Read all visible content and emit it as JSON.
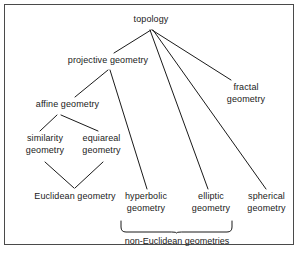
{
  "figure": {
    "type": "hierarchy-tree-diagram",
    "background_color": "#ffffff",
    "line_color": "#1a1a1a",
    "text_color": "#1a1a1a",
    "border_color": "#4a4a4a",
    "width": 299,
    "height": 253
  },
  "nodes": [
    {
      "id": "topology",
      "label": "topology",
      "x": 127,
      "y": 14,
      "w": 48
    },
    {
      "id": "projective-geometry",
      "label": "projective geometry",
      "x": 60,
      "y": 55,
      "w": 96
    },
    {
      "id": "affine-geometry",
      "label": "affine geometry",
      "x": 29,
      "y": 99,
      "w": 77
    },
    {
      "id": "similarity-geometry",
      "label": "similarity\ngeometry",
      "x": 20,
      "y": 133,
      "w": 50
    },
    {
      "id": "equiareal-geometry",
      "label": "equiareal\ngeometry",
      "x": 76,
      "y": 133,
      "w": 51
    },
    {
      "id": "euclidean-geometry",
      "label": "Euclidean geometry",
      "x": 23,
      "y": 191,
      "w": 104
    },
    {
      "id": "hyperbolic-geometry",
      "label": "hyperbolic\ngeometry",
      "x": 120,
      "y": 191,
      "w": 52
    },
    {
      "id": "elliptic-geometry",
      "label": "elliptic\ngeometry",
      "x": 188,
      "y": 191,
      "w": 46
    },
    {
      "id": "spherical-geometry",
      "label": "spherical\ngeometry",
      "x": 241,
      "y": 191,
      "w": 51
    },
    {
      "id": "fractal-geometry",
      "label": "fractal\ngeometry",
      "x": 223,
      "y": 82,
      "w": 46
    }
  ],
  "edges": [
    {
      "from": "topology",
      "to": "projective-geometry",
      "x1": 151,
      "y1": 30,
      "x2": 114,
      "y2": 53
    },
    {
      "from": "topology",
      "to": "fractal-geometry",
      "x1": 152,
      "y1": 30,
      "x2": 231,
      "y2": 80
    },
    {
      "from": "topology",
      "to": "spherical-geometry",
      "x1": 153,
      "y1": 30,
      "x2": 266,
      "y2": 189
    },
    {
      "from": "topology",
      "to": "elliptic-geometry",
      "x1": 150,
      "y1": 30,
      "x2": 208,
      "y2": 189
    },
    {
      "from": "projective-geometry",
      "to": "affine-geometry",
      "x1": 108,
      "y1": 70,
      "x2": 75,
      "y2": 97
    },
    {
      "from": "projective-geometry",
      "to": "hyperbolic-geometry",
      "x1": 110,
      "y1": 70,
      "x2": 147,
      "y2": 189
    },
    {
      "from": "affine-geometry",
      "to": "similarity-geometry",
      "x1": 57,
      "y1": 115,
      "x2": 40,
      "y2": 131
    },
    {
      "from": "affine-geometry",
      "to": "equiareal-geometry",
      "x1": 61,
      "y1": 115,
      "x2": 98,
      "y2": 131
    },
    {
      "from": "similarity-geometry",
      "to": "euclidean-geometry",
      "x1": 45,
      "y1": 162,
      "x2": 74,
      "y2": 188
    },
    {
      "from": "equiareal-geometry",
      "to": "euclidean-geometry",
      "x1": 103,
      "y1": 162,
      "x2": 75,
      "y2": 188
    }
  ],
  "brace": {
    "label": "non-Euclidean geometries",
    "covers": [
      "hyperbolic-geometry",
      "elliptic-geometry"
    ],
    "left_x": 121,
    "right_x": 232,
    "top_y": 221,
    "tip_y": 233,
    "label_x": 118,
    "label_y": 236,
    "label_w": 118
  }
}
